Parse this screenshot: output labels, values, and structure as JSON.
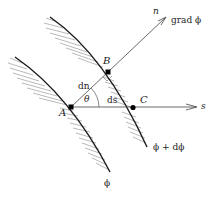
{
  "diagram": {
    "labels": {
      "n": "n",
      "grad": "grad ϕ",
      "B": "B",
      "dn": "dn",
      "theta": "θ",
      "ds": "ds",
      "A": "A",
      "C": "C",
      "s": "s",
      "phi_plus": "ϕ + dϕ",
      "phi": "ϕ"
    },
    "points": {
      "A": [
        71,
        107
      ],
      "B": [
        108,
        72
      ],
      "C": [
        133,
        108
      ]
    },
    "colors": {
      "line": "#333333",
      "curve": "#1a1a1a",
      "hatch": "#777777"
    }
  }
}
